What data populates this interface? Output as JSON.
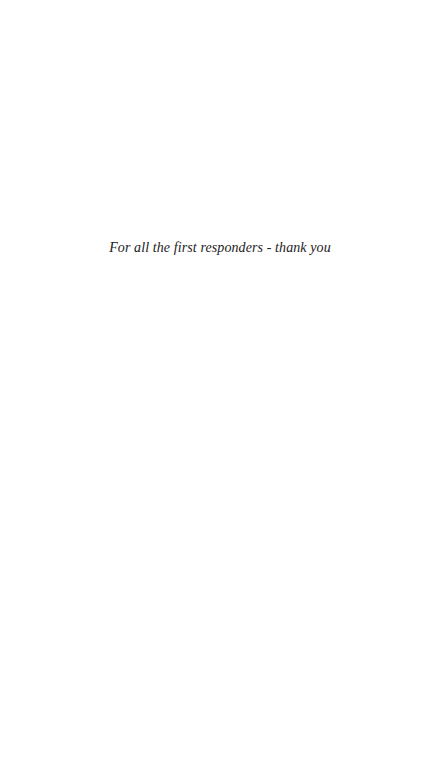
{
  "page": {
    "dedication": "For all the first responders - thank you",
    "background_color": "#ffffff",
    "text_color": "#222222"
  }
}
